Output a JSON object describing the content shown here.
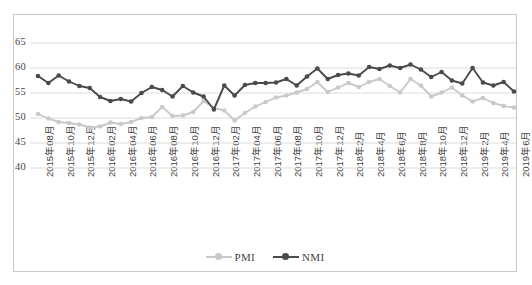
{
  "chart_data": {
    "type": "line",
    "title": "",
    "xlabel": "",
    "ylabel": "",
    "ylim": [
      40,
      65
    ],
    "yticks": [
      40,
      45,
      50,
      55,
      60,
      65
    ],
    "grid": true,
    "legend_position": "bottom",
    "x": [
      "2015年08月",
      "2015年09月",
      "2015年10月",
      "2015年11月",
      "2015年12月",
      "2016年01月",
      "2016年02月",
      "2016年03月",
      "2016年04月",
      "2016年05月",
      "2016年06月",
      "2016年07月",
      "2016年08月",
      "2016年09月",
      "2016年10月",
      "2016年11月",
      "2016年12月",
      "2017年01月",
      "2017年02月",
      "2017年03月",
      "2017年04月",
      "2017年05月",
      "2017年06月",
      "2017年07月",
      "2017年08月",
      "2017年09月",
      "2017年10月",
      "2017年11月",
      "2017年12月",
      "2018年1月",
      "2018年2月",
      "2018年3月",
      "2018年4月",
      "2018年5月",
      "2018年6月",
      "2018年7月",
      "2018年8月",
      "2018年9月",
      "2018年10月",
      "2018年11月",
      "2018年12月",
      "2019年1月",
      "2019年2月",
      "2019年3月",
      "2019年4月",
      "2019年5月",
      "2019年6月"
    ],
    "xtick_labels": [
      "2015年08月",
      "2015年10月",
      "2015年12月",
      "2016年02月",
      "2016年04月",
      "2016年06月",
      "2016年08月",
      "2016年10月",
      "2016年12月",
      "2017年02月",
      "2017年04月",
      "2017年06月",
      "2017年08月",
      "2017年10月",
      "2017年12月",
      "2018年2月",
      "2018年4月",
      "2018年6月",
      "2018年8月",
      "2018年10月",
      "2018年12月",
      "2019年2月",
      "2019年4月",
      "2019年6月"
    ],
    "xtick_indices": [
      0,
      2,
      4,
      6,
      8,
      10,
      12,
      14,
      16,
      18,
      20,
      22,
      24,
      26,
      28,
      30,
      32,
      34,
      36,
      38,
      40,
      42,
      44,
      46
    ],
    "series": [
      {
        "name": "PMI",
        "color": "#c9c9c9",
        "values": [
          50.8,
          49.9,
          49.2,
          49.0,
          48.7,
          48.1,
          48.3,
          49.1,
          48.8,
          49.2,
          50.0,
          50.2,
          52.2,
          50.4,
          50.5,
          51.2,
          53.4,
          52.0,
          51.5,
          49.5,
          51.0,
          52.3,
          53.2,
          54.1,
          54.5,
          55.1,
          55.8,
          57.2,
          55.2,
          56.1,
          57.0,
          56.2,
          57.2,
          57.8,
          56.4,
          55.1,
          57.8,
          56.5,
          54.3,
          55.1,
          56.1,
          54.5,
          53.3,
          54.0,
          53.0,
          52.4,
          52.1
        ]
      },
      {
        "name": "NMI",
        "color": "#4a4a4a",
        "values": [
          58.4,
          57.0,
          58.5,
          57.3,
          56.4,
          56.0,
          54.2,
          53.4,
          53.8,
          53.3,
          55.0,
          56.2,
          55.6,
          54.3,
          56.4,
          55.1,
          54.3,
          51.7,
          56.5,
          54.5,
          56.6,
          57.0,
          57.0,
          57.1,
          57.8,
          56.5,
          58.3,
          59.9,
          57.8,
          58.6,
          58.9,
          58.5,
          60.2,
          59.8,
          60.5,
          60.0,
          60.7,
          59.7,
          58.2,
          59.2,
          57.5,
          56.9,
          60.0,
          57.1,
          56.5,
          57.2,
          55.3
        ]
      }
    ]
  },
  "legend": {
    "items": [
      {
        "label": "PMI",
        "color": "#c9c9c9"
      },
      {
        "label": "NMI",
        "color": "#4a4a4a"
      }
    ]
  }
}
